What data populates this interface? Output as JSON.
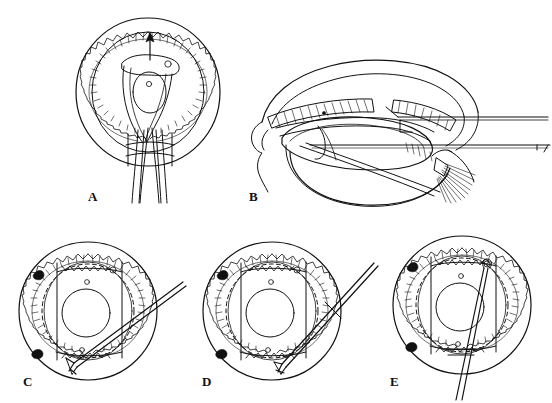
{
  "figure": {
    "background_color": "#ffffff",
    "ink_color": "#111111",
    "width": 552,
    "height": 403,
    "style": "black-and-white line drawing, medical textbook plate"
  },
  "panels": [
    {
      "id": "A",
      "label": "A",
      "label_x": 88,
      "label_y": 201,
      "view": "anterior (en face) view of globe",
      "caption": "Anterior view showing scleral flap retracted, arrow indicating direction toward ciliary processes, with suture threads exiting inferiorly through the scleral incision",
      "features": [
        "outer limbal circle",
        "inner sclera circle",
        "scalloped ciliary process ring",
        "retracted scleral/iris flap",
        "pupil opening",
        "direction arrow pointing superiorly",
        "paired suture threads exiting inferiorly",
        "rectangular scleral incision site",
        "two small circular fixation marks"
      ]
    },
    {
      "id": "B",
      "label": "B",
      "label_x": 249,
      "label_y": 201,
      "view": "sagittal (lateral cross-section) view of anterior segment",
      "caption": "Cross-sectional view of the anterior segment showing cornea, iris, ciliary body with processes, lens and zonular fibers, with two instruments introduced horizontally from the right",
      "features": [
        "cornea profile",
        "anterior chamber",
        "iris leaf",
        "ciliary body with hatched processes",
        "lens capsule",
        "zonular fiber fan",
        "upper instrument shaft",
        "lower instrument shaft with angled tip",
        "conjunctival fold at left"
      ]
    },
    {
      "id": "C",
      "label": "C",
      "label_x": 23,
      "label_y": 386,
      "view": "anterior (en face) view of globe",
      "caption": "Needle passed obliquely from superotemporal entry, tip directed toward the inferonasal quadrant",
      "features": [
        "outer limbal circle",
        "scalloped ciliary process ring",
        "dashed inner landmark circle",
        "pupil opening",
        "oblique double-line needle shaft",
        "flanged needle tip",
        "two solid black limbal marker dots",
        "two small circular fixation marks"
      ],
      "needle": {
        "angle_deg": -36,
        "tip_position": "inferonasal",
        "entry": "superotemporal"
      }
    },
    {
      "id": "D",
      "label": "D",
      "label_x": 202,
      "label_y": 386,
      "view": "anterior (en face) view of globe",
      "caption": "Needle advanced at a steeper oblique angle with the tip reaching the inferior ciliary sulcus",
      "features": [
        "outer limbal circle",
        "scalloped ciliary process ring",
        "dashed inner landmark circle",
        "pupil opening",
        "steep oblique double-line needle shaft",
        "flanged needle tip",
        "two solid black limbal marker dots",
        "two small circular fixation marks"
      ],
      "needle": {
        "angle_deg": -52,
        "tip_position": "inferior",
        "entry": "superotemporal"
      }
    },
    {
      "id": "E",
      "label": "E",
      "label_x": 390,
      "label_y": 386,
      "view": "anterior (en face) view of globe",
      "caption": "Needle oriented near-vertically through the pupil with the looped tip superiorly and the shaft exiting inferiorly",
      "features": [
        "outer limbal circle",
        "scalloped ciliary process ring",
        "dashed inner landmark circle",
        "pupil opening",
        "near-vertical needle shaft",
        "looped needle tip",
        "needle exiting inferior limbus",
        "two solid black limbal marker dots",
        "two small circular fixation marks"
      ],
      "needle": {
        "angle_deg": -83,
        "tip_position": "superior",
        "entry": "inferior"
      }
    }
  ]
}
